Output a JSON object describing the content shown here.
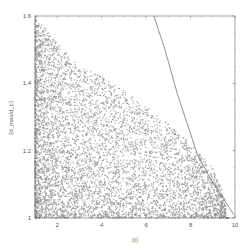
{
  "chart_data": {
    "type": "scatter",
    "title": "",
    "xlabel": "⟨t⟩",
    "ylabel": "⟨d_max/d_c⟩",
    "xlim": [
      1,
      10
    ],
    "ylim": [
      1.0,
      1.6
    ],
    "xticks": [
      2,
      4,
      6,
      8,
      10
    ],
    "xtick_labels": [
      "2",
      "4",
      "6",
      "8",
      "10"
    ],
    "yticks": [
      1.0,
      1.2,
      1.4,
      1.6
    ],
    "ytick_labels": [
      "1",
      "1.2",
      "1.4",
      "1.6"
    ],
    "grid": false,
    "legend": null,
    "series": [
      {
        "name": "samples",
        "kind": "scatter",
        "color": "#8a8a8a",
        "n_points": 6000,
        "description": "Dense cloud concentrated at low x (1–3) and low y (1.0–1.1); density decreases toward larger x and larger y; sparse points extend to x≈9.5 at low y",
        "approx_envelope": [
          [
            1,
            1.6
          ],
          [
            2,
            1.52
          ],
          [
            3,
            1.45
          ],
          [
            4,
            1.42
          ],
          [
            5,
            1.38
          ],
          [
            6,
            1.33
          ],
          [
            7,
            1.28
          ],
          [
            8,
            1.22
          ],
          [
            9,
            1.15
          ],
          [
            9.6,
            1.05
          ]
        ]
      },
      {
        "name": "bound",
        "kind": "line",
        "color": "#777777",
        "x": [
          6.35,
          6.85,
          7.4,
          7.85,
          8.3,
          8.95,
          9.95
        ],
        "y": [
          1.6,
          1.5,
          1.37,
          1.28,
          1.19,
          1.11,
          1.01
        ]
      }
    ]
  }
}
